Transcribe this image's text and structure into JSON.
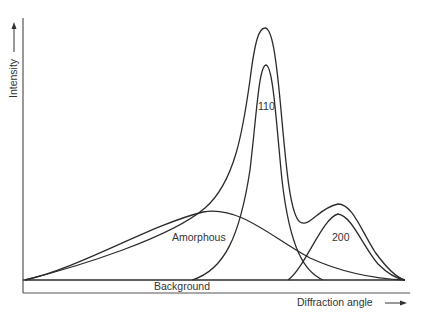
{
  "diagram": {
    "y_axis_label": "Intensity",
    "x_axis_label": "Diffraction angle",
    "components": [
      {
        "name": "envelope",
        "label": ""
      },
      {
        "name": "peak-110",
        "label": "110"
      },
      {
        "name": "peak-200",
        "label": "200"
      },
      {
        "name": "amorphous-halo",
        "label": "Amorphous"
      },
      {
        "name": "background",
        "label": "Background"
      }
    ],
    "colors": {
      "line": "#2b2b2b",
      "axis": "#555555",
      "text": "#333333",
      "background": "#ffffff"
    }
  },
  "labels": {
    "intensity": "Intensity",
    "diffraction_angle": "Diffraction angle",
    "peak_110": "110",
    "peak_200": "200",
    "amorphous": "Amorphous",
    "background": "Background"
  }
}
